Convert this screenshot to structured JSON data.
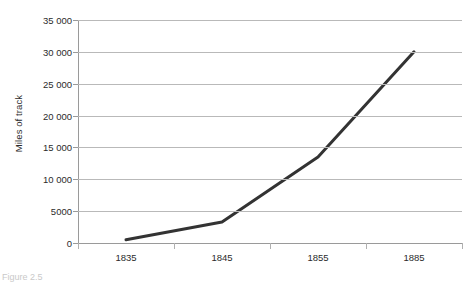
{
  "chart_data": {
    "type": "line",
    "title": "",
    "xlabel": "",
    "ylabel": "Miles of track",
    "categories": [
      "1835",
      "1845",
      "1855",
      "1885"
    ],
    "values": [
      500,
      3300,
      13500,
      30000
    ],
    "series": [
      {
        "name": "Miles of track",
        "values": [
          500,
          3300,
          13500,
          30000
        ]
      }
    ],
    "ylim": [
      0,
      35000
    ],
    "ytick_values": [
      0,
      5000,
      10000,
      15000,
      20000,
      25000,
      30000,
      35000
    ],
    "ytick_labels": [
      "0",
      "5000",
      "10 000",
      "15 000",
      "20 000",
      "25 000",
      "30 000",
      "35 000"
    ],
    "grid": "horizontal",
    "legend": "none",
    "line_color": "#333333",
    "grid_color": "#b9b9b9",
    "axis_color": "#9a9a9a"
  },
  "figure": {
    "caption": "Figure 2.5"
  }
}
